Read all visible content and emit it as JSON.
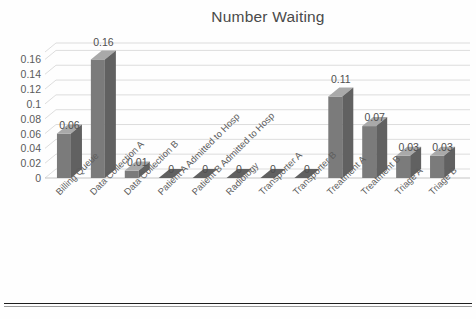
{
  "chart_data": {
    "type": "bar",
    "title": "Number Waiting",
    "xlabel": "",
    "ylabel": "",
    "ylim": [
      0,
      0.16
    ],
    "grid": true,
    "legend": "none",
    "style": "3d-column",
    "categories": [
      "Billing Queue",
      "Data Collection A",
      "Data Collection B",
      "Patient A Admitted to Hosp",
      "Patient B Admitted to Hosp",
      "Radiology",
      "Transporter A",
      "Transporter B",
      "Treatment A",
      "Treatment B",
      "Triage A",
      "Triage B"
    ],
    "values": [
      0.06,
      0.16,
      0.01,
      0,
      0,
      0,
      0,
      0,
      0.11,
      0.07,
      0.03,
      0.03
    ],
    "data_labels": [
      "0.06",
      "0.16",
      "0.01",
      "0",
      "0",
      "0",
      "0",
      "0",
      "0.11",
      "0.07",
      "0.03",
      "0.03"
    ],
    "y_ticks": [
      0,
      0.02,
      0.04,
      0.06,
      0.08,
      0.1,
      0.12,
      0.14,
      0.16
    ],
    "y_tick_labels": [
      "0",
      "0.02",
      "0.04",
      "0.06",
      "0.08",
      "0.1",
      "0.12",
      "0.14",
      "0.16"
    ],
    "colors": {
      "bar_front": "#7b7b7b",
      "bar_top": "#a9a9a9",
      "bar_side": "#616161",
      "gridline": "#d9d9d9",
      "text": "#545454",
      "background": "#fefefe"
    }
  }
}
